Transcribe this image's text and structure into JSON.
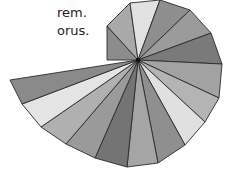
{
  "caption": {
    "lines": [
      "rem.",
      "orus."
    ]
  },
  "figure": {
    "name": "Spiral of Theodorus",
    "center": [
      138,
      60
    ],
    "stroke_color": "#2a2a2a",
    "center_dot_color": "#111111",
    "outer_vertices": [
      [
        107,
        60
      ],
      [
        107,
        26
      ],
      [
        130,
        3
      ],
      [
        160,
        0
      ],
      [
        190,
        10
      ],
      [
        211,
        33
      ],
      [
        222,
        64
      ],
      [
        219,
        98
      ],
      [
        205,
        122
      ],
      [
        185,
        145
      ],
      [
        158,
        163
      ],
      [
        127,
        167
      ],
      [
        95,
        158
      ],
      [
        66,
        144
      ],
      [
        41,
        127
      ],
      [
        22,
        104
      ],
      [
        10,
        80
      ]
    ],
    "triangle_fills": [
      "#8c8c8c",
      "#a9a9a9",
      "#e2e2e2",
      "#8e8e8e",
      "#9b9b9b",
      "#7a7a7a",
      "#a2a2a2",
      "#b4b4b4",
      "#e0e0e0",
      "#8f8f8f",
      "#a5a5a5",
      "#747474",
      "#9a9a9a",
      "#b0b0b0",
      "#e4e4e4",
      "#8a8a8a"
    ]
  }
}
